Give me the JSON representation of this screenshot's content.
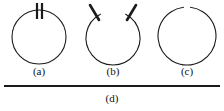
{
  "figure": {
    "background_color": "#ffffff",
    "stroke_color": "#1a1a1a",
    "panels": [
      {
        "id": "a",
        "label": "(a)",
        "shape": "circle",
        "description": "closed circle with two short thick vertical parallel tick marks at the top",
        "center_x": 37,
        "center_y": 37,
        "radius": 27,
        "stroke_width": 1.1,
        "gap": false,
        "marks": [
          {
            "kind": "vertical-bar",
            "x": 35,
            "y_top": 3,
            "y_bottom": 19,
            "width": 2.2
          },
          {
            "kind": "vertical-bar",
            "x": 40,
            "y_top": 3,
            "y_bottom": 19,
            "width": 2.2
          }
        ]
      },
      {
        "id": "b",
        "label": "(b)",
        "shape": "open-circle",
        "description": "circle open at the top with two short thick angled strokes splaying outward from the gap ends",
        "center_x": 37,
        "center_y": 38,
        "radius": 27,
        "stroke_width": 1.1,
        "gap": true,
        "gap_start_deg": -118,
        "gap_end_deg": -62,
        "marks": [
          {
            "kind": "angled-stroke",
            "x1": 14,
            "y1": 5,
            "x2": 23,
            "y2": 20,
            "width": 2.6
          },
          {
            "kind": "angled-stroke",
            "x1": 60,
            "y1": 5,
            "x2": 51,
            "y2": 20,
            "width": 2.6
          }
        ]
      },
      {
        "id": "c",
        "label": "(c)",
        "shape": "open-circle",
        "description": "circle with a small gap at the top",
        "center_x": 37,
        "center_y": 36,
        "radius": 29,
        "stroke_width": 1.1,
        "gap": true,
        "gap_start_deg": -97,
        "gap_end_deg": -83,
        "marks": []
      }
    ],
    "rule": {
      "id": "d",
      "label": "(d)",
      "shape": "horizontal-line",
      "description": "long straight horizontal line spanning the figure width",
      "x1": 4,
      "x2": 220,
      "y": 6,
      "stroke_width": 1.8
    }
  }
}
